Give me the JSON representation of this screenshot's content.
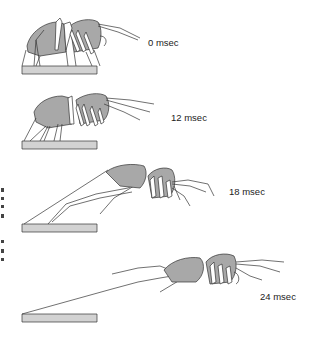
{
  "figure": {
    "colors": {
      "body_fill": "#a8a8a8",
      "platform_fill": "#d2d2d2",
      "outline": "#333333",
      "leg_fill": "#ffffff"
    },
    "frames": [
      {
        "id": "frame-0",
        "time_label": "0 msec"
      },
      {
        "id": "frame-12",
        "time_label": "12 msec"
      },
      {
        "id": "frame-18",
        "time_label": "18 msec"
      },
      {
        "id": "frame-24",
        "time_label": "24 msec"
      }
    ]
  }
}
